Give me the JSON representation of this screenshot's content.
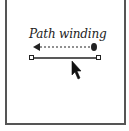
{
  "diagram": {
    "caption": "Path winding",
    "colors": {
      "stroke": "#222222",
      "frame": "#555555",
      "background": "#ffffff"
    },
    "elements": [
      {
        "type": "dashed-arrow",
        "direction": "left",
        "start_marker": "filled-circle",
        "end_marker": "arrowhead"
      },
      {
        "type": "path-segment",
        "endpoints": "square-anchors"
      },
      {
        "type": "cursor",
        "icon": "arrow-pointer"
      }
    ]
  }
}
